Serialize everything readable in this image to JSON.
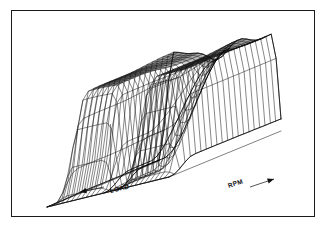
{
  "figure": {
    "kind": "3d-wireframe-surface-plot",
    "border_color": "#1a1a1a",
    "background_color": "#ffffff",
    "mesh_color": "#101010",
    "width": 327,
    "height": 229
  },
  "axes": {
    "x_label": "LOAD",
    "y_label": "RPM",
    "x_arrow": "arrow-left",
    "y_arrow": "arrow-right"
  },
  "chart_data": {
    "type": "surface",
    "title": "",
    "xlabel": "LOAD",
    "ylabel": "RPM",
    "zlabel": "",
    "grid": true,
    "legend": false,
    "projection": "isometric-wireframe",
    "nx": 26,
    "ny": 22,
    "x": [
      0,
      0.04,
      0.08,
      0.12,
      0.16,
      0.2,
      0.24,
      0.28,
      0.32,
      0.36,
      0.4,
      0.44,
      0.48,
      0.52,
      0.56,
      0.6,
      0.64,
      0.68,
      0.72,
      0.76,
      0.8,
      0.84,
      0.88,
      0.92,
      0.96,
      1.0
    ],
    "y": [
      0,
      0.048,
      0.095,
      0.143,
      0.19,
      0.238,
      0.286,
      0.333,
      0.381,
      0.429,
      0.476,
      0.524,
      0.571,
      0.619,
      0.667,
      0.714,
      0.762,
      0.81,
      0.857,
      0.905,
      0.952,
      1.0
    ],
    "zlim": [
      0,
      1
    ],
    "features": {
      "plateau_level": 0.92,
      "base_level": 0.0,
      "notch_x_center": 0.52,
      "notch_half_width": 0.055,
      "notch_depth": 0.0,
      "crest_ripple_amplitude": 0.06,
      "front_slope_start": 0.22,
      "left_shoulder": 0.12,
      "right_shoulder": 0.93
    }
  }
}
